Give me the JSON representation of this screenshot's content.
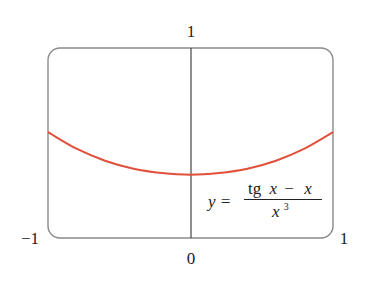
{
  "chart_data": {
    "type": "line",
    "title": "",
    "xlabel": "",
    "ylabel": "",
    "xlim": [
      -1,
      1
    ],
    "ylim": [
      0,
      1
    ],
    "grid": false,
    "legend": "none",
    "tick_labels": {
      "y_top": "1",
      "x_left": "−1",
      "x_right": "1",
      "x_origin": "0"
    },
    "annotation": {
      "lhs": "y =",
      "numerator_func": "tg",
      "numerator_var1": "x",
      "numerator_minus": "−",
      "numerator_var2": "x",
      "denominator_var": "x",
      "denominator_exp": "3"
    },
    "series": [
      {
        "name": "y = (tg x − x) / x³",
        "color": "#e0503a",
        "x": [
          -1.0,
          -0.8,
          -0.6,
          -0.4,
          -0.2,
          0.0,
          0.2,
          0.4,
          0.6,
          0.8,
          1.0
        ],
        "y": [
          0.557,
          0.47,
          0.407,
          0.365,
          0.342,
          0.333,
          0.342,
          0.365,
          0.407,
          0.47,
          0.557
        ]
      }
    ]
  },
  "colors": {
    "frame": "#8a8a8a",
    "axis": "#333333",
    "curve": "#e0503a"
  }
}
